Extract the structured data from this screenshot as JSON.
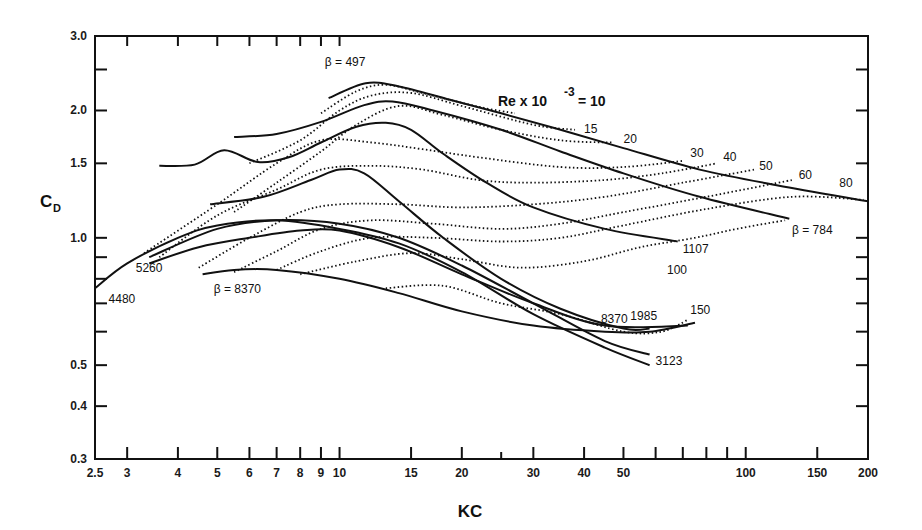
{
  "chart_data": {
    "type": "line",
    "title": "",
    "xlabel": "KC",
    "ylabel": "C_D",
    "xscale": "log",
    "yscale": "log",
    "xlim": [
      2.5,
      200
    ],
    "ylim": [
      0.3,
      3.0
    ],
    "grid": false,
    "legend": "inline curve labels",
    "x_ticks": [
      {
        "v": 2.5,
        "label": "2.5"
      },
      {
        "v": 3,
        "label": "3"
      },
      {
        "v": 4,
        "label": "4"
      },
      {
        "v": 5,
        "label": "5"
      },
      {
        "v": 6,
        "label": "6"
      },
      {
        "v": 7,
        "label": "7"
      },
      {
        "v": 8,
        "label": "8"
      },
      {
        "v": 9,
        "label": "9"
      },
      {
        "v": 10,
        "label": "10"
      },
      {
        "v": 15,
        "label": "15"
      },
      {
        "v": 20,
        "label": "20"
      },
      {
        "v": 25,
        "label": ""
      },
      {
        "v": 30,
        "label": "30"
      },
      {
        "v": 40,
        "label": "40"
      },
      {
        "v": 50,
        "label": "50"
      },
      {
        "v": 60,
        "label": ""
      },
      {
        "v": 70,
        "label": ""
      },
      {
        "v": 80,
        "label": ""
      },
      {
        "v": 90,
        "label": ""
      },
      {
        "v": 100,
        "label": "100"
      },
      {
        "v": 150,
        "label": "150"
      },
      {
        "v": 200,
        "label": "200"
      }
    ],
    "y_ticks": [
      {
        "v": 0.3,
        "label": "0.3"
      },
      {
        "v": 0.4,
        "label": "0.4"
      },
      {
        "v": 0.5,
        "label": "0.5"
      },
      {
        "v": 0.6,
        "label": ""
      },
      {
        "v": 0.7,
        "label": ""
      },
      {
        "v": 0.8,
        "label": ""
      },
      {
        "v": 0.9,
        "label": ""
      },
      {
        "v": 1.0,
        "label": "1.0"
      },
      {
        "v": 1.5,
        "label": "1.5"
      },
      {
        "v": 2.0,
        "label": "2.0"
      },
      {
        "v": 2.5,
        "label": ""
      },
      {
        "v": 3.0,
        "label": "3.0"
      }
    ],
    "series_beta": [
      {
        "name": "β = 497",
        "label": "β = 497",
        "label_pos": [
          9.2,
          2.55
        ],
        "points": [
          [
            9.4,
            2.14
          ],
          [
            11.6,
            2.32
          ],
          [
            14,
            2.28
          ],
          [
            18.7,
            2.12
          ],
          [
            25,
            1.97
          ],
          [
            35,
            1.8
          ],
          [
            50,
            1.63
          ],
          [
            77,
            1.45
          ],
          [
            120,
            1.33
          ],
          [
            200,
            1.22
          ]
        ]
      },
      {
        "name": "β = 784",
        "label": "β = 784",
        "label_pos": [
          130,
          1.02
        ],
        "points": [
          [
            5.5,
            1.73
          ],
          [
            7,
            1.76
          ],
          [
            9,
            1.88
          ],
          [
            11.5,
            2.06
          ],
          [
            13.5,
            2.1
          ],
          [
            17,
            2.0
          ],
          [
            25,
            1.8
          ],
          [
            35,
            1.6
          ],
          [
            50,
            1.42
          ],
          [
            77,
            1.25
          ],
          [
            128,
            1.11
          ]
        ]
      },
      {
        "name": "β = 1107",
        "label": "1107",
        "label_pos": [
          70,
          0.92
        ],
        "points": [
          [
            3.6,
            1.48
          ],
          [
            4.4,
            1.49
          ],
          [
            5.2,
            1.61
          ],
          [
            6.3,
            1.51
          ],
          [
            7.5,
            1.55
          ],
          [
            9,
            1.68
          ],
          [
            11,
            1.83
          ],
          [
            13,
            1.87
          ],
          [
            15,
            1.8
          ],
          [
            18,
            1.58
          ],
          [
            23,
            1.35
          ],
          [
            30,
            1.18
          ],
          [
            45,
            1.05
          ],
          [
            68,
            0.98
          ]
        ]
      },
      {
        "name": "β = 1985",
        "label": "1985",
        "label_pos": [
          52,
          0.64
        ],
        "points": [
          [
            4.8,
            1.2
          ],
          [
            6.5,
            1.25
          ],
          [
            8.5,
            1.37
          ],
          [
            10,
            1.45
          ],
          [
            11.5,
            1.42
          ],
          [
            14,
            1.22
          ],
          [
            18,
            1.0
          ],
          [
            25,
            0.8
          ],
          [
            35,
            0.68
          ],
          [
            50,
            0.61
          ],
          [
            58,
            0.61
          ]
        ]
      },
      {
        "name": "β = 3123",
        "label": "3123",
        "label_pos": [
          60,
          0.5
        ],
        "points": [
          [
            3.4,
            0.9
          ],
          [
            5,
            1.05
          ],
          [
            7,
            1.1
          ],
          [
            10,
            1.08
          ],
          [
            14,
            1.0
          ],
          [
            20,
            0.86
          ],
          [
            30,
            0.7
          ],
          [
            45,
            0.57
          ],
          [
            58,
            0.53
          ]
        ]
      },
      {
        "name": "β = 4480",
        "label": "4480",
        "label_pos": [
          2.7,
          0.7
        ],
        "points": [
          [
            2.5,
            0.76
          ],
          [
            3,
            0.87
          ],
          [
            4,
            1.0
          ],
          [
            5,
            1.07
          ],
          [
            7,
            1.1
          ],
          [
            10,
            1.05
          ],
          [
            14,
            0.97
          ],
          [
            20,
            0.83
          ],
          [
            30,
            0.66
          ],
          [
            45,
            0.55
          ],
          [
            58,
            0.5
          ]
        ]
      },
      {
        "name": "β = 5260",
        "label": "5260",
        "label_pos": [
          3.15,
          0.83
        ],
        "points": [
          [
            3.4,
            0.87
          ],
          [
            4.5,
            0.95
          ],
          [
            6,
            1.0
          ],
          [
            8,
            1.04
          ],
          [
            10,
            1.04
          ],
          [
            14,
            0.95
          ],
          [
            20,
            0.82
          ],
          [
            30,
            0.7
          ],
          [
            45,
            0.62
          ],
          [
            72,
            0.62
          ]
        ]
      },
      {
        "name": "β = 8370",
        "label": "β = 8370",
        "label_pos": [
          4.9,
          0.74
        ],
        "points": [
          [
            4.6,
            0.82
          ],
          [
            5.5,
            0.84
          ],
          [
            7,
            0.84
          ],
          [
            10,
            0.8
          ],
          [
            14,
            0.74
          ],
          [
            20,
            0.67
          ],
          [
            30,
            0.62
          ],
          [
            45,
            0.6
          ],
          [
            58,
            0.6
          ],
          [
            75,
            0.63
          ]
        ]
      },
      {
        "name": "β = 8370 (upper branch label)",
        "label": "8370",
        "label_pos": [
          44,
          0.63
        ],
        "points": []
      }
    ],
    "series_re": [
      {
        "name": "Re×10⁻³ = 10",
        "label": "",
        "points": [
          [
            9,
            1.97
          ],
          [
            11,
            2.22
          ],
          [
            13,
            2.3
          ],
          [
            16,
            2.2
          ],
          [
            22,
            2.04
          ],
          [
            27,
            1.97
          ]
        ]
      },
      {
        "name": "Re×10⁻³ = 15",
        "label": "15",
        "label_pos": [
          40,
          1.77
        ],
        "points": [
          [
            6,
            1.5
          ],
          [
            8,
            1.7
          ],
          [
            10,
            2.0
          ],
          [
            12,
            2.17
          ],
          [
            15,
            2.2
          ],
          [
            20,
            2.05
          ],
          [
            30,
            1.85
          ],
          [
            38,
            1.8
          ]
        ]
      },
      {
        "name": "Re×10⁻³ = 20",
        "label": "20",
        "label_pos": [
          50,
          1.68
        ],
        "points": [
          [
            5.5,
            1.15
          ],
          [
            7,
            1.35
          ],
          [
            9,
            1.6
          ],
          [
            11,
            1.85
          ],
          [
            14,
            2.05
          ],
          [
            18,
            1.95
          ],
          [
            25,
            1.8
          ],
          [
            35,
            1.7
          ],
          [
            47,
            1.68
          ]
        ]
      },
      {
        "name": "Re×10⁻³ = 30",
        "label": "30",
        "label_pos": [
          73,
          1.55
        ],
        "points": [
          [
            3.3,
            0.92
          ],
          [
            5,
            1.2
          ],
          [
            7,
            1.5
          ],
          [
            9,
            1.7
          ],
          [
            12,
            1.68
          ],
          [
            16,
            1.62
          ],
          [
            22,
            1.55
          ],
          [
            35,
            1.47
          ],
          [
            50,
            1.47
          ],
          [
            70,
            1.52
          ]
        ]
      },
      {
        "name": "Re×10⁻³ = 40",
        "label": "40",
        "label_pos": [
          88,
          1.52
        ],
        "points": [
          [
            3.6,
            0.9
          ],
          [
            5,
            1.13
          ],
          [
            7,
            1.3
          ],
          [
            9,
            1.45
          ],
          [
            12,
            1.48
          ],
          [
            16,
            1.45
          ],
          [
            22,
            1.37
          ],
          [
            30,
            1.35
          ],
          [
            45,
            1.37
          ],
          [
            62,
            1.42
          ],
          [
            85,
            1.5
          ]
        ]
      },
      {
        "name": "Re×10⁻³ = 50",
        "label": "50",
        "label_pos": [
          108,
          1.45
        ],
        "points": [
          [
            4.5,
            0.85
          ],
          [
            6,
            1.0
          ],
          [
            8,
            1.15
          ],
          [
            10,
            1.2
          ],
          [
            14,
            1.2
          ],
          [
            20,
            1.18
          ],
          [
            30,
            1.2
          ],
          [
            45,
            1.25
          ],
          [
            70,
            1.35
          ],
          [
            105,
            1.45
          ]
        ]
      },
      {
        "name": "Re×10⁻³ = 60",
        "label": "60",
        "label_pos": [
          135,
          1.38
        ],
        "points": [
          [
            5.5,
            0.83
          ],
          [
            7,
            0.93
          ],
          [
            9,
            1.05
          ],
          [
            12,
            1.1
          ],
          [
            17,
            1.08
          ],
          [
            25,
            1.05
          ],
          [
            35,
            1.08
          ],
          [
            50,
            1.15
          ],
          [
            80,
            1.25
          ],
          [
            130,
            1.37
          ]
        ]
      },
      {
        "name": "Re×10⁻³ = 80",
        "label": "80",
        "label_pos": [
          170,
          1.32
        ],
        "points": [
          [
            7,
            0.84
          ],
          [
            9,
            0.93
          ],
          [
            12,
            1.0
          ],
          [
            17,
            1.0
          ],
          [
            25,
            0.98
          ],
          [
            35,
            1.0
          ],
          [
            50,
            1.07
          ],
          [
            80,
            1.17
          ],
          [
            130,
            1.25
          ],
          [
            195,
            1.23
          ]
        ]
      },
      {
        "name": "Re×10⁻³ = 100",
        "label": "100",
        "label_pos": [
          64,
          0.82
        ],
        "points": [
          [
            8,
            0.82
          ],
          [
            11,
            0.88
          ],
          [
            15,
            0.92
          ],
          [
            20,
            0.89
          ],
          [
            28,
            0.85
          ],
          [
            40,
            0.88
          ],
          [
            55,
            0.95
          ],
          [
            75,
            1.0
          ],
          [
            95,
            1.05
          ],
          [
            125,
            1.1
          ]
        ]
      },
      {
        "name": "Re×10⁻³ = 150",
        "label": "150",
        "label_pos": [
          73,
          0.66
        ],
        "points": [
          [
            13,
            0.76
          ],
          [
            18,
            0.77
          ],
          [
            25,
            0.7
          ],
          [
            35,
            0.66
          ],
          [
            50,
            0.6
          ],
          [
            62,
            0.6
          ],
          [
            72,
            0.64
          ]
        ]
      }
    ],
    "annotations": [
      {
        "text": "Re x 10^-3 = 10",
        "pos": [
          26,
          2.06
        ]
      }
    ]
  },
  "labels": {
    "y_axis_main": "C",
    "y_axis_sub": "D",
    "x_axis": "KC",
    "re_label_prefix": "Re x 10",
    "re_label_exp": "-3",
    "re_label_suffix": " = 10"
  }
}
